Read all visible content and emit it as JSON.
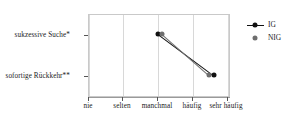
{
  "chart_data": {
    "type": "line",
    "title": "",
    "subtitle": "",
    "xlabel": "",
    "ylabel": "",
    "grid": "vertical",
    "legend_position": "right",
    "categories": [
      "nie",
      "selten",
      "manchmal",
      "häufig",
      "sehr häufig"
    ],
    "x_tick_labels": [
      "nie",
      "selten",
      "manchmal",
      "häufig",
      "sehr häufig"
    ],
    "x_tick_values": [
      1,
      2,
      3,
      4,
      5
    ],
    "xlim": [
      0.6,
      5.4
    ],
    "y_tick_labels": [
      "sukzessive Suche*",
      "sofortige Rückkehr**"
    ],
    "y_tick_values": [
      2,
      1
    ],
    "ylim": [
      0.45,
      2.45
    ],
    "series": [
      {
        "name": "IG",
        "color": "#111111",
        "marker": "filled-circle",
        "line": true,
        "points": [
          {
            "x": 2.93,
            "y": 2,
            "x_label": "manchmal",
            "y_label": "sukzessive Suche*"
          },
          {
            "x": 4.82,
            "y": 1,
            "x_label": "sehr häufig",
            "y_label": "sofortige Rückkehr**"
          }
        ]
      },
      {
        "name": "NIG",
        "color": "#6e6e6e",
        "marker": "filled-circle",
        "line": true,
        "points": [
          {
            "x": 3.06,
            "y": 2,
            "x_label": "manchmal",
            "y_label": "sukzessive Suche*"
          },
          {
            "x": 4.66,
            "y": 1,
            "x_label": "sehr häufig",
            "y_label": "sofortige Rückkehr**"
          }
        ]
      }
    ],
    "annotations": [
      "*",
      "**"
    ]
  },
  "legend": {
    "entries": [
      {
        "label": "IG"
      },
      {
        "label": "NIG"
      }
    ]
  },
  "axes": {
    "y": {
      "ticks": [
        {
          "label": "sukzessive Suche*"
        },
        {
          "label": "sofortige Rückkehr**"
        }
      ]
    },
    "x": {
      "ticks": [
        {
          "label": "nie"
        },
        {
          "label": "selten"
        },
        {
          "label": "manchmal"
        },
        {
          "label": "häufig"
        },
        {
          "label": "sehr häufig"
        }
      ]
    }
  },
  "colors": {
    "ig": "#111111",
    "nig": "#6e6e6e",
    "grid": "#d8d8d8",
    "panel_border": "#c9c9c9",
    "axis": "#9a9a9a",
    "text": "#1a1a1a",
    "background": "#ffffff"
  }
}
